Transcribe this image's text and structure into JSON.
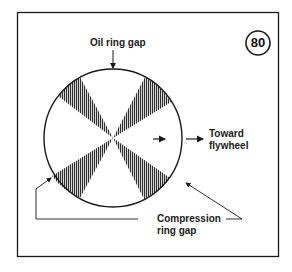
{
  "figure": {
    "badge_number": "80",
    "labels": {
      "oil_ring_gap": "Oil ring gap",
      "toward_flywheel_line1": "Toward",
      "toward_flywheel_line2": "flywheel",
      "compression_line1": "Compression",
      "compression_line2": "ring gap"
    },
    "colors": {
      "ink": "#1a1a1a",
      "background": "#ffffff",
      "shading": "#3a3a3a"
    }
  }
}
